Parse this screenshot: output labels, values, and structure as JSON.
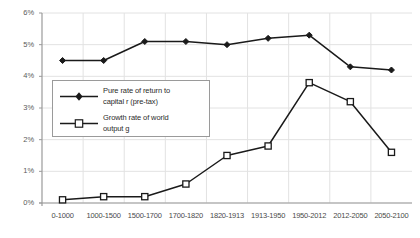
{
  "chart_data": {
    "type": "line",
    "title": "",
    "xlabel": "",
    "ylabel": "",
    "ylim": [
      0,
      6
    ],
    "yticks": [
      "0%",
      "1%",
      "2%",
      "3%",
      "4%",
      "5%",
      "6%"
    ],
    "ytick_values": [
      0,
      1,
      2,
      3,
      4,
      5,
      6
    ],
    "grid": true,
    "legend_position": "inside-left",
    "categories": [
      "0-1000",
      "1000-1500",
      "1500-1700",
      "1700-1820",
      "1820-1913",
      "1913-1950",
      "1950-2012",
      "2012-2050",
      "2050-2100"
    ],
    "series": [
      {
        "name": "Pure rate of return to capital r (pre-tax)",
        "marker": "filled-diamond",
        "color": "#1a1a1a",
        "values": [
          4.5,
          4.5,
          5.1,
          5.1,
          5.0,
          5.2,
          5.3,
          4.3,
          4.2
        ]
      },
      {
        "name": "Growth rate of world output g",
        "marker": "open-square",
        "color": "#1a1a1a",
        "values": [
          0.1,
          0.2,
          0.2,
          0.6,
          1.5,
          1.8,
          3.8,
          3.2,
          1.6
        ]
      }
    ]
  },
  "legend": {
    "entries": [
      {
        "label_line1": "Pure rate of return to",
        "label_line2": "capital r (pre-tax)"
      },
      {
        "label_line1": "Growth rate of world",
        "label_line2": "output g"
      }
    ]
  },
  "colors": {
    "grid": "#e2e2e2",
    "axis": "#9a9a9a",
    "line": "#1a1a1a",
    "legend_border": "#9a9a9a",
    "tick_text": "#4a4a4a"
  }
}
